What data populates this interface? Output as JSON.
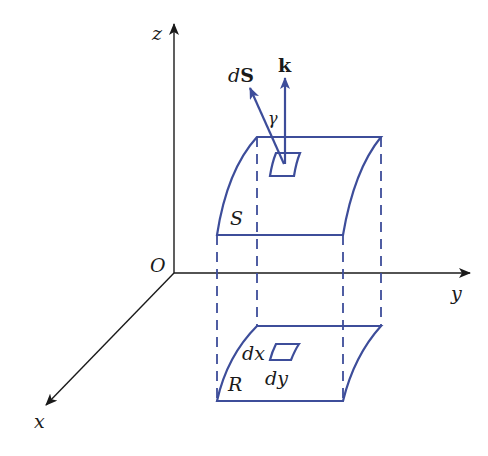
{
  "diagram": {
    "type": "surface-projection",
    "colors": {
      "axis": "#1a1a1a",
      "surface": "#3d4d9a",
      "background": "#ffffff"
    },
    "axes": {
      "origin_label": "O",
      "x_label": "x",
      "y_label": "y",
      "z_label": "z"
    },
    "surface": {
      "label": "S"
    },
    "region": {
      "label": "R"
    },
    "vectors": {
      "normal_label_prefix": "d",
      "normal_label_bold": "S",
      "k_label": "k",
      "angle_label": "γ"
    },
    "element": {
      "dx_label": "dx",
      "dy_label": "dy"
    }
  }
}
